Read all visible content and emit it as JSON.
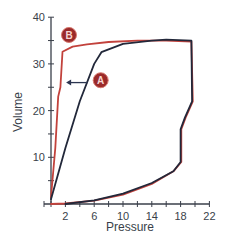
{
  "chart_data": {
    "type": "line",
    "title": "",
    "xlabel": "Pressure",
    "ylabel": "Volume",
    "xlim": [
      0,
      22
    ],
    "ylim": [
      0,
      40
    ],
    "x_ticks": [
      2,
      6,
      10,
      14,
      18,
      22
    ],
    "x_minor_tick_step": 2,
    "y_ticks": [
      10,
      20,
      30,
      40
    ],
    "y_minor_tick_step": 5,
    "grid": false,
    "legend": "none",
    "series": [
      {
        "name": "A",
        "color": "#2b3550",
        "points": [
          [
            0,
            1
          ],
          [
            2,
            12
          ],
          [
            4,
            22
          ],
          [
            6,
            30
          ],
          [
            7,
            32.5
          ],
          [
            10,
            34.3
          ],
          [
            14,
            35
          ],
          [
            16,
            35.2
          ],
          [
            19.5,
            35
          ],
          [
            19.6,
            22
          ],
          [
            18.6,
            18.5
          ],
          [
            18,
            16
          ],
          [
            18,
            9
          ],
          [
            17,
            7
          ],
          [
            14,
            4.5
          ],
          [
            10,
            2.2
          ],
          [
            6,
            0.8
          ],
          [
            2,
            0
          ]
        ]
      },
      {
        "name": "B",
        "color": "#c2423c",
        "points": [
          [
            0,
            1.5
          ],
          [
            0.6,
            12
          ],
          [
            1,
            23
          ],
          [
            1.3,
            25
          ],
          [
            1.6,
            32.6
          ],
          [
            3,
            33.7
          ],
          [
            5,
            34.2
          ],
          [
            8,
            34.7
          ],
          [
            12,
            35
          ],
          [
            16,
            35
          ],
          [
            19.5,
            34.8
          ],
          [
            19.7,
            22
          ],
          [
            18.7,
            18.5
          ],
          [
            18.1,
            16
          ],
          [
            18.1,
            9
          ],
          [
            17,
            7
          ],
          [
            14,
            4.3
          ],
          [
            10,
            2
          ],
          [
            6,
            0.7
          ],
          [
            2,
            0.1
          ],
          [
            0,
            0
          ]
        ]
      }
    ],
    "annotations": [
      {
        "label": "A",
        "x": 6.9,
        "y": 26.5,
        "style": "circle-badge"
      },
      {
        "label": "B",
        "x": 2.5,
        "y": 36.2,
        "style": "circle-badge"
      },
      {
        "type": "arrow",
        "from": [
          5.1,
          26
        ],
        "to": [
          2.1,
          26
        ],
        "color": "#2b3550"
      }
    ]
  },
  "labels": {
    "x_axis_title": "Pressure",
    "y_axis_title": "Volume",
    "badge_a": "A",
    "badge_b": "B",
    "x_tick_labels": [
      "2",
      "6",
      "10",
      "14",
      "18",
      "22"
    ],
    "y_tick_labels": [
      "10",
      "20",
      "30",
      "40"
    ]
  },
  "colors": {
    "axis": "#3a3f4a",
    "series_a": "#22283a",
    "series_b": "#c2423c",
    "badge_fill": "#9b2a2a",
    "badge_ring": "#d77a70"
  }
}
